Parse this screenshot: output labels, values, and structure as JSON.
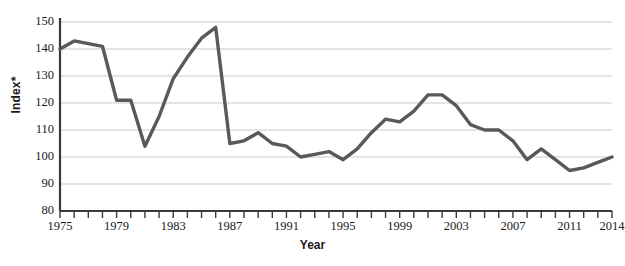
{
  "chart_data": {
    "type": "line",
    "title": "",
    "xlabel": "Year",
    "ylabel": "Index*",
    "xlim": [
      1975,
      2014
    ],
    "ylim": [
      80,
      150
    ],
    "ytick_labels": [
      "150",
      "140",
      "130",
      "120",
      "110",
      "100",
      "90",
      "80"
    ],
    "ytick_values": [
      150,
      140,
      130,
      120,
      110,
      100,
      90,
      80
    ],
    "xtick_labels": [
      "1975",
      "1979",
      "1983",
      "1987",
      "1991",
      "1995",
      "1999",
      "2003",
      "2007",
      "2011",
      "2014"
    ],
    "xtick_values": [
      1975,
      1979,
      1983,
      1987,
      1991,
      1995,
      1999,
      2003,
      2007,
      2011,
      2014
    ],
    "grid": "horizontal",
    "legend": "none",
    "line_color": "#595959",
    "line_width": 3.4,
    "axis_color": "#3a3a3a",
    "grid_color": "#c9c9c9",
    "x": [
      1975,
      1976,
      1977,
      1978,
      1979,
      1980,
      1981,
      1982,
      1983,
      1984,
      1985,
      1986,
      1987,
      1988,
      1989,
      1990,
      1991,
      1992,
      1993,
      1994,
      1995,
      1996,
      1997,
      1998,
      1999,
      2000,
      2001,
      2002,
      2003,
      2004,
      2005,
      2006,
      2007,
      2008,
      2009,
      2010,
      2011,
      2012,
      2013,
      2014
    ],
    "values": [
      140,
      143,
      142,
      141,
      121,
      121,
      104,
      115,
      129,
      137,
      144,
      148,
      105,
      106,
      109,
      105,
      104,
      100,
      101,
      102,
      99,
      103,
      109,
      114,
      113,
      117,
      123,
      123,
      119,
      112,
      110,
      110,
      106,
      99,
      103,
      99,
      95,
      96,
      98,
      100
    ],
    "series_name": "Index"
  }
}
